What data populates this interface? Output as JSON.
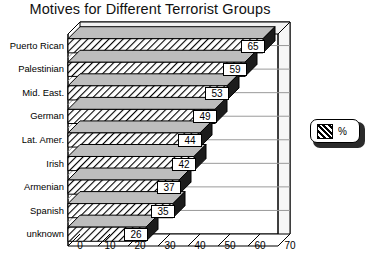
{
  "chart_data": {
    "type": "bar",
    "orientation": "horizontal",
    "title": "Motives for Different Terrorist Groups",
    "xlabel": "",
    "ylabel": "",
    "categories": [
      "Puerto Rican",
      "Palestinian",
      "Mid. East.",
      "German",
      "Lat. Amer.",
      "Irish",
      "Armenian",
      "Spanish",
      "unknown"
    ],
    "values": [
      65,
      59,
      53,
      49,
      44,
      42,
      37,
      35,
      26
    ],
    "data_labels": [
      "65",
      "59",
      "53",
      "49",
      "44",
      "42",
      "37",
      "35",
      "26"
    ],
    "xticks": [
      "0",
      "10",
      "20",
      "30",
      "40",
      "50",
      "60",
      "70"
    ],
    "xtick_values": [
      0,
      10,
      20,
      30,
      40,
      50,
      60,
      70
    ],
    "xlim": [
      0,
      70
    ],
    "grid": false,
    "style": "3d",
    "legend": {
      "position": "right",
      "entries": [
        {
          "label": "%",
          "pattern": "diagonal-hatch"
        }
      ]
    },
    "colors": {
      "bar_fill": "#ffffff",
      "bar_hatch": "#000000",
      "bar_side": "#1a1a1a",
      "outline": "#000000",
      "background": "#ffffff"
    }
  }
}
